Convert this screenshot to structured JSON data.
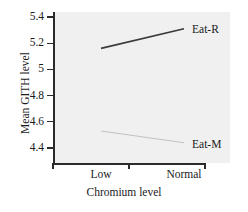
{
  "chart_data": {
    "type": "line",
    "title": "",
    "subtitle": "",
    "xlabel": "Chromium level",
    "ylabel": "Mean GITH level",
    "categories": [
      "Low",
      "Normal"
    ],
    "series": [
      {
        "name": "Eat-R",
        "values": [
          5.16,
          5.31
        ],
        "color": "#3b3b3b",
        "width": 1.7
      },
      {
        "name": "Eat-M",
        "values": [
          4.53,
          4.44
        ],
        "color": "#c2c2c2",
        "width": 1.0
      }
    ],
    "ylim": [
      4.3,
      5.45
    ],
    "yticks": [
      5.4,
      5.2,
      5,
      4.8,
      4.6,
      4.4
    ],
    "ytick_labels": [
      "5.4",
      "5.2",
      "5",
      "4.8",
      "4.6",
      "4.4"
    ],
    "xticks": [
      "",
      "",
      ""
    ],
    "grid": false,
    "legend": "inline-right-of-line",
    "panel_color": "#f0f0f0",
    "axis_color": "#2b2b2b"
  },
  "axes": {
    "y_title": "Mean GITH level",
    "x_title": "Chromium level",
    "y_tick_labels": [
      "5.4",
      "5.2",
      "5",
      "4.8",
      "4.6",
      "4.4"
    ],
    "x_tick_labels": [
      "Low",
      "Normal"
    ]
  },
  "annotations": {
    "eat_r_label": "Eat-R",
    "eat_m_label": "Eat-M"
  }
}
